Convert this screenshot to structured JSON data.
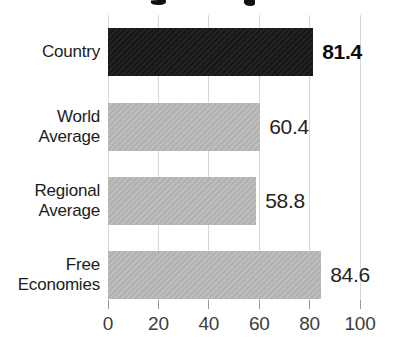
{
  "chart_data": {
    "type": "bar",
    "orientation": "horizontal",
    "title_visible": "",
    "categories": [
      "Country",
      "World Average",
      "Regional Average",
      "Free Economies"
    ],
    "values": [
      81.4,
      60.4,
      58.8,
      84.6
    ],
    "value_labels": [
      "81.4",
      "60.4",
      "58.8",
      "84.6"
    ],
    "emphasized_index": 0,
    "xlim": [
      0,
      100
    ],
    "x_ticks": [
      0,
      20,
      40,
      60,
      80,
      100
    ],
    "x_tick_labels": [
      "0",
      "20",
      "40",
      "60",
      "80",
      "100"
    ],
    "grid": true,
    "legend": "none",
    "colors": {
      "emphasized_bar": "#1b1b1b",
      "default_bar": "#b7b7b7",
      "gridline": "#d8d8d8",
      "tick": "#9a9a9a",
      "value_text": "#242424",
      "label_text": "#1c1c1c",
      "background": "#ffffff"
    }
  }
}
